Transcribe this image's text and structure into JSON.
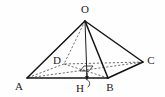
{
  "figure": {
    "width": 165,
    "height": 97,
    "background_color": "#fefefe",
    "line_color": "#141414",
    "dash_color": "#4a4a4a",
    "label_color": "#1a1a1a"
  },
  "vertices": [
    {
      "id": "O",
      "label": "O",
      "x": 85,
      "y": 21,
      "label_x": 85,
      "label_y": 10,
      "style": "apex"
    },
    {
      "id": "A",
      "label": "A",
      "x": 27,
      "y": 78,
      "label_x": 19,
      "label_y": 87,
      "style": "base"
    },
    {
      "id": "B",
      "label": "B",
      "x": 108,
      "y": 78,
      "label_x": 110,
      "label_y": 88,
      "style": "base"
    },
    {
      "id": "C",
      "label": "C",
      "x": 143,
      "y": 62,
      "label_x": 151,
      "label_y": 61,
      "style": "base"
    },
    {
      "id": "D",
      "label": "D",
      "x": 64,
      "y": 64,
      "label_x": 57,
      "label_y": 61,
      "style": "base-hidden"
    },
    {
      "id": "H",
      "label": "H",
      "x": 87,
      "y": 78,
      "label_x": 80,
      "label_y": 89,
      "style": "foot"
    }
  ],
  "edges": [
    {
      "id": "OA",
      "from": "O",
      "to": "A",
      "kind": "solid"
    },
    {
      "id": "OB",
      "from": "O",
      "to": "B",
      "kind": "solid"
    },
    {
      "id": "OC",
      "from": "O",
      "to": "C",
      "kind": "solid"
    },
    {
      "id": "OD",
      "from": "O",
      "to": "D",
      "kind": "dashed"
    },
    {
      "id": "AB",
      "from": "A",
      "to": "B",
      "kind": "solid"
    },
    {
      "id": "BC",
      "from": "B",
      "to": "C",
      "kind": "solid"
    },
    {
      "id": "CD",
      "from": "C",
      "to": "D",
      "kind": "dashed"
    },
    {
      "id": "DA",
      "from": "D",
      "to": "A",
      "kind": "dashed"
    },
    {
      "id": "AC",
      "from": "A",
      "to": "C",
      "kind": "dashed"
    },
    {
      "id": "DB",
      "from": "D",
      "to": "B",
      "kind": "dashed"
    },
    {
      "id": "OH",
      "from": "O",
      "to": "H",
      "kind": "thin"
    }
  ],
  "annotations": {
    "right_angle_marker": {
      "name": "right-angle-marker-at-H",
      "points": "80,71 84,66 93,66 89,71"
    },
    "arrow_to_foot": {
      "name": "arrow-pointing-to-H",
      "from_x": 87,
      "from_y": 73,
      "to_x": 87,
      "to_y": 78
    },
    "leader_curve": {
      "name": "leader-line-from-H-label",
      "path": "M 86,79 C 90,81 91,84 88,87"
    }
  }
}
